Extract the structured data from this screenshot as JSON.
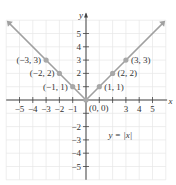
{
  "chart_data": {
    "type": "line",
    "title": "",
    "xlabel": "x",
    "ylabel": "y",
    "function_label": "y = |x|",
    "xlim": [
      -6,
      6
    ],
    "ylim": [
      -6,
      6
    ],
    "grid": true,
    "x_ticks": [
      -5,
      -4,
      -3,
      -2,
      -1,
      1,
      2,
      3,
      4,
      5
    ],
    "x_tick_labels": [
      "−5",
      "−4",
      "−3",
      "−2",
      "−1",
      "3",
      "4",
      "5"
    ],
    "y_ticks": [
      -5,
      -4,
      -3,
      -2,
      -1,
      1,
      2,
      3,
      4,
      5
    ],
    "y_tick_labels": [
      "5",
      "4",
      "3",
      "2",
      "1",
      "−2",
      "−3",
      "−4",
      "−5"
    ],
    "series": [
      {
        "name": "y = |x|",
        "x": [
          -3,
          -2,
          -1,
          0,
          1,
          2,
          3
        ],
        "y": [
          3,
          2,
          1,
          0,
          1,
          2,
          3
        ],
        "color": "#9e9e9e"
      }
    ],
    "points": [
      {
        "x": -3,
        "y": 3,
        "label": "(−3, 3)"
      },
      {
        "x": -2,
        "y": 2,
        "label": "(−2, 2)"
      },
      {
        "x": -1,
        "y": 1,
        "label": "(−1, 1)"
      },
      {
        "x": 0,
        "y": 0,
        "label": "(0, 0)"
      },
      {
        "x": 1,
        "y": 1,
        "label": "(1, 1)"
      },
      {
        "x": 2,
        "y": 2,
        "label": "(2, 2)"
      },
      {
        "x": 3,
        "y": 3,
        "label": "(3, 3)"
      }
    ],
    "colors": {
      "axis": "#444444",
      "grid": "#e6e6e6",
      "line": "#a0a0a0",
      "point": "#a8a8a8"
    }
  }
}
